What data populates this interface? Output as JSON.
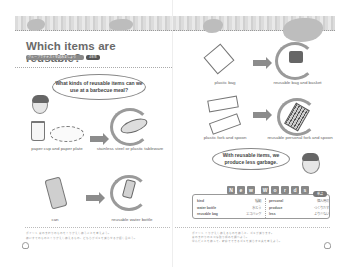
{
  "left_page": {
    "title": "Which items are reusable?",
    "subtitle_bar": "グループでテキストを読みましょう",
    "subtitle_tag": "4年生",
    "speech_bubble": "What kinds of reusable items can we use at a barbecue meal?",
    "items": [
      {
        "before": "paper cup and paper plate",
        "after": "stainless steel or plastic tableware"
      },
      {
        "before": "can",
        "after": "reusable water bottle"
      }
    ],
    "footnotes": [
      "ポイント 身のまわりのものをくりかえし使うことを考えよう。",
      "使いすてのものとくりかえし使えるもの、どちらがゴミを減らせるか話し合おう。"
    ]
  },
  "right_page": {
    "items": [
      {
        "before": "plastic bag",
        "after": "reusable bag and basket"
      },
      {
        "before": "plastic fork and spoon",
        "after": "reusable personal fork and spoon"
      }
    ],
    "speech_bubble": "With reusable items, we produce less garbage.",
    "new_words": {
      "header_letters": [
        "N",
        "e",
        "w",
        "W",
        "o",
        "r",
        "d",
        "s"
      ],
      "badge": "単語",
      "left_column": [
        {
          "en": "kind",
          "jp": "種類"
        },
        {
          "en": "water bottle",
          "jp": "水とう"
        },
        {
          "en": "reusable bag",
          "jp": "エコバッグ"
        }
      ],
      "right_column": [
        {
          "en": "personal",
          "jp": "個人用の"
        },
        {
          "en": "produce",
          "jp": "つくりだす"
        },
        {
          "en": "less",
          "jp": "より少ない"
        }
      ]
    },
    "footnotes": [
      "ポイント くりかえし使えるものを使うと、ゴミが減ります。",
      "身のまわりのエコな取り組みを調べよう。",
      "学んだことを使って、家庭でできるゴミを減らす工夫を考えよう。"
    ]
  }
}
